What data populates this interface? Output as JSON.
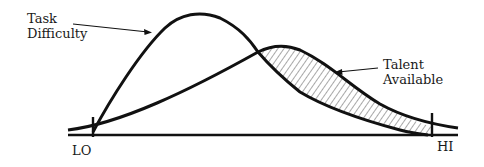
{
  "diagram": {
    "labels": {
      "task_difficulty_line1": "Task",
      "task_difficulty_line2": "Difficulty",
      "talent_available_line1": "Talent",
      "talent_available_line2": "Available",
      "axis_low": "LO",
      "axis_high": "HI"
    },
    "curves": [
      {
        "name": "Task Difficulty",
        "shape": "skewed-left peak, high and narrow"
      },
      {
        "name": "Talent Available",
        "shape": "skewed-right, lower broad peak"
      }
    ],
    "shaded_region": "area where Talent Available exceeds Task Difficulty (right side), hatched",
    "colors": {
      "stroke": "#111111",
      "background": "#ffffff",
      "hatch": "#444444"
    }
  }
}
